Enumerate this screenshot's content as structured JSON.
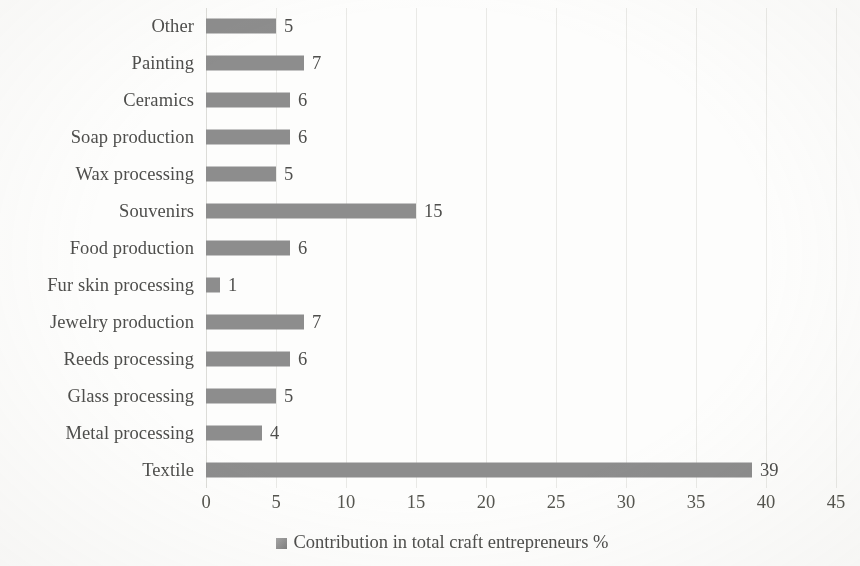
{
  "chart_data": {
    "type": "bar",
    "orientation": "horizontal",
    "title": "",
    "xlabel": "",
    "ylabel": "",
    "xlim": [
      0,
      45
    ],
    "xticks": [
      0,
      5,
      10,
      15,
      20,
      25,
      30,
      35,
      40,
      45
    ],
    "grid": true,
    "grid_axis": "x",
    "legend_position": "bottom",
    "bar_color": "#8d8d8d",
    "text_color": "#4e4e4c",
    "background": "#fdfdfc",
    "series": [
      {
        "name": "Contribution in total craft entrepreneurs %",
        "values": [
          5,
          7,
          6,
          6,
          5,
          15,
          6,
          1,
          7,
          6,
          5,
          4,
          39
        ]
      }
    ],
    "categories": [
      "Other",
      "Painting",
      "Ceramics",
      "Soap production",
      "Wax processing",
      "Souvenirs",
      "Food production",
      "Fur skin processing",
      "Jewelry production",
      "Reeds processing",
      "Glass processing",
      "Metal processing",
      "Textile"
    ],
    "data_labels": [
      "5",
      "7",
      "6",
      "6",
      "5",
      "15",
      "6",
      "1",
      "7",
      "6",
      "5",
      "4",
      "39"
    ]
  },
  "legend": {
    "items": [
      {
        "label": "Contribution in total craft entrepreneurs %",
        "color": "#8d8d8d"
      }
    ]
  }
}
